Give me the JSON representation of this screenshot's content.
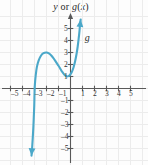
{
  "figure": {
    "title_parts": {
      "y": "y",
      "or": " or ",
      "g": "g",
      "paren_open": "(",
      "x": "x",
      "paren_close": ")"
    },
    "title_text": "y or g(x)",
    "curve_label": "g",
    "background_color": "#fdfdfd",
    "grid_color": "#ececec",
    "axis_color": "#595959",
    "curve_color": "#4ba8c9"
  },
  "chart_data": {
    "type": "line",
    "title": "y or g(x)",
    "xlabel": "x",
    "ylabel": "y or g(x)",
    "xlim": [
      -5.8,
      5.8
    ],
    "ylim": [
      -5.8,
      5.8
    ],
    "grid": true,
    "legend_position": "none",
    "annotations": [
      {
        "text": "g",
        "x": 1.35,
        "y": 4.2
      }
    ],
    "x_ticks": [
      -5,
      -4,
      -3,
      -2,
      -1,
      1,
      2,
      3,
      4,
      5
    ],
    "x_tick_labels": [
      "-5",
      "-4",
      "-3",
      "-2",
      "-1",
      "1",
      "2",
      "3",
      "4",
      "5"
    ],
    "y_ticks": [
      5,
      4,
      3,
      2,
      1,
      -1,
      -2,
      -3,
      -4,
      -5
    ],
    "y_tick_labels": [
      "5",
      "4",
      "3",
      "2",
      "1",
      "-1",
      "-2",
      "-3",
      "-4",
      "-5"
    ],
    "series": [
      {
        "name": "g",
        "color": "#4ba8c9",
        "arrow_start": true,
        "arrow_end": true,
        "features": {
          "local_maximum": [
            -2.0,
            3.0
          ],
          "local_minimum": [
            -0.3,
            1.0
          ],
          "x_intercept": [
            -3.0,
            0.0
          ],
          "y_intercept": [
            0.0,
            1.15
          ]
        },
        "points": [
          [
            -3.25,
            -5.6
          ],
          [
            -3.2,
            -5.0
          ],
          [
            -3.15,
            -4.2
          ],
          [
            -3.1,
            -3.3
          ],
          [
            -3.06,
            -2.4
          ],
          [
            -3.02,
            -1.4
          ],
          [
            -3.0,
            -0.5
          ],
          [
            -2.97,
            0.3
          ],
          [
            -2.9,
            1.1
          ],
          [
            -2.8,
            1.8
          ],
          [
            -2.65,
            2.35
          ],
          [
            -2.45,
            2.75
          ],
          [
            -2.25,
            2.95
          ],
          [
            -2.0,
            3.0
          ],
          [
            -1.8,
            2.92
          ],
          [
            -1.6,
            2.75
          ],
          [
            -1.4,
            2.5
          ],
          [
            -1.2,
            2.2
          ],
          [
            -1.0,
            1.9
          ],
          [
            -0.85,
            1.65
          ],
          [
            -0.7,
            1.4
          ],
          [
            -0.55,
            1.2
          ],
          [
            -0.42,
            1.07
          ],
          [
            -0.3,
            1.0
          ],
          [
            -0.18,
            1.03
          ],
          [
            -0.05,
            1.12
          ],
          [
            0.1,
            1.35
          ],
          [
            0.25,
            1.75
          ],
          [
            0.38,
            2.25
          ],
          [
            0.5,
            2.85
          ],
          [
            0.6,
            3.5
          ],
          [
            0.68,
            4.15
          ],
          [
            0.75,
            4.8
          ],
          [
            0.8,
            5.4
          ],
          [
            0.85,
            5.75
          ]
        ]
      }
    ]
  },
  "tick_positions": {
    "x": [
      {
        "label": "-5",
        "left": 11,
        "top": 90
      },
      {
        "label": "-4",
        "left": 23,
        "top": 90
      },
      {
        "label": "-3",
        "left": 35,
        "top": 90
      },
      {
        "label": "-2",
        "left": 47,
        "top": 90
      },
      {
        "label": "-1",
        "left": 59,
        "top": 90
      },
      {
        "label": "1",
        "left": 81,
        "top": 90
      },
      {
        "label": "2",
        "left": 93,
        "top": 90
      },
      {
        "label": "3",
        "left": 105,
        "top": 90
      },
      {
        "label": "4",
        "left": 117,
        "top": 90
      },
      {
        "label": "5",
        "left": 129,
        "top": 90
      }
    ],
    "y": [
      {
        "label": "5",
        "left": 64,
        "top": 25
      },
      {
        "label": "4",
        "left": 64,
        "top": 37
      },
      {
        "label": "3",
        "left": 64,
        "top": 49
      },
      {
        "label": "2",
        "left": 64,
        "top": 61
      },
      {
        "label": "1",
        "left": 64,
        "top": 73
      },
      {
        "label": "-1",
        "left": 61,
        "top": 97
      },
      {
        "label": "-2",
        "left": 61,
        "top": 109
      },
      {
        "label": "-3",
        "left": 61,
        "top": 121
      },
      {
        "label": "-4",
        "left": 61,
        "top": 133
      },
      {
        "label": "-5",
        "left": 61,
        "top": 145
      }
    ]
  }
}
